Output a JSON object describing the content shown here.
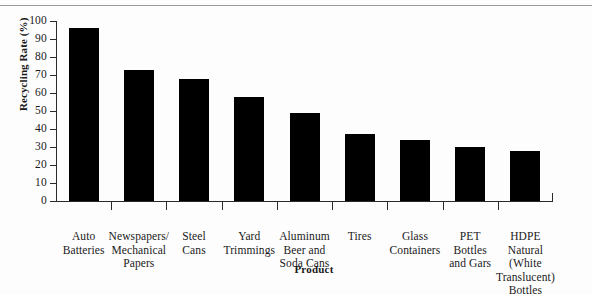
{
  "chart_data": {
    "type": "bar",
    "title": "",
    "xlabel": "Product",
    "ylabel": "Recycling Rate (%)",
    "ylim": [
      0,
      100
    ],
    "ytick_labels": [
      "100",
      "90",
      "80",
      "70",
      "60",
      "50",
      "40",
      "30",
      "20",
      "10",
      "0"
    ],
    "ytick_values": [
      100,
      90,
      80,
      70,
      60,
      50,
      40,
      30,
      20,
      10,
      0
    ],
    "grid": false,
    "legend": null,
    "bar_color": "#000000",
    "background_color": "#fdfdfd",
    "axis_color": "#2a2a2a",
    "categories": [
      "Auto\nBatteries",
      "Newspapers/\nMechanical\nPapers",
      "Steel\nCans",
      "Yard\nTrimmings",
      "Aluminum\nBeer and\nSoda Cans",
      "Tires",
      "Glass\nContainers",
      "PET\nBottles\nand Gars",
      "HDPE\nNatural\n(White\nTranslucent)\nBottles"
    ],
    "values": [
      96,
      73,
      68,
      58,
      49,
      37,
      34,
      30,
      28
    ]
  }
}
